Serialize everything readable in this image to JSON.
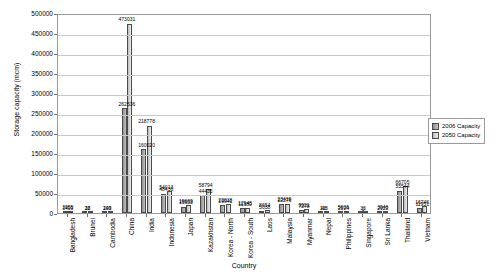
{
  "chart_data": {
    "type": "bar",
    "title": "",
    "xlabel": "Country",
    "ylabel": "Storage capacity (mcm)",
    "ylim": [
      0,
      500000
    ],
    "ytick_step": 50000,
    "grid": true,
    "legend_position": "right",
    "categories": [
      "Bangladesh",
      "Brunei",
      "Cambodia",
      "China",
      "India",
      "Indonesia",
      "Japan",
      "Kazakhstan",
      "Korea - North",
      "Korea - South",
      "Laos",
      "Malaysia",
      "Myanmar",
      "Nepal",
      "Philippines",
      "Singapore",
      "Sri Lanka",
      "Thailand",
      "Vietnam"
    ],
    "series": [
      {
        "name": "2006 Capacity",
        "color": "#b0b0b0",
        "values": [
          3955,
          38,
          209,
          262536,
          160020,
          48430,
          15633,
          44435,
          19941,
          11380,
          5038,
          22276,
          7278,
          48,
          2524,
          0,
          2022,
          55544,
          11951
        ]
      },
      {
        "name": "2050 Capacity",
        "color": "#d9d9d9",
        "values": [
          1409,
          22,
          143,
          473031,
          218778,
          54013,
          19669,
          58794,
          22018,
          12945,
          8654,
          23419,
          9921,
          113,
          5006,
          33,
          3946,
          66705,
          16746
        ]
      }
    ],
    "yticks": [
      "0",
      "50000",
      "100000",
      "150000",
      "200000",
      "250000",
      "300000",
      "350000",
      "400000",
      "450000",
      "500000"
    ],
    "point_labels": {
      "Bangladesh": {
        "top": "3955",
        "bottom": "1409"
      },
      "Brunei": {
        "top": "38",
        "bottom": "22"
      },
      "Cambodia": {
        "top": "209",
        "bottom": "143"
      },
      "China": {
        "top": "473031",
        "bottom": "262536"
      },
      "India": {
        "top": "218778",
        "bottom": "160020"
      },
      "Indonesia": {
        "top": "54013",
        "bottom": "48430"
      },
      "Japan": {
        "top": "19669",
        "bottom": "15633"
      },
      "Kazakhstan": {
        "top": "58794",
        "bottom": "44435"
      },
      "Korea - North": {
        "top": "22018",
        "bottom": "19941"
      },
      "Korea - South": {
        "top": "12945",
        "bottom": "11380"
      },
      "Laos": {
        "top": "8654",
        "bottom": "5038"
      },
      "Malaysia": {
        "top": "23419",
        "bottom": "22276"
      },
      "Myanmar": {
        "top": "9921",
        "bottom": "7278"
      },
      "Nepal": {
        "top": "113",
        "bottom": "48"
      },
      "Philippines": {
        "top": "5006",
        "bottom": "2524"
      },
      "Singapore": {
        "top": "33",
        "bottom": "0"
      },
      "Sri Lanka": {
        "top": "3946",
        "bottom": "2022"
      },
      "Thailand": {
        "top": "66705",
        "bottom": "55544"
      },
      "Vietnam": {
        "top": "16746",
        "bottom": "11951"
      }
    }
  },
  "legend": {
    "items": [
      {
        "label": "2006 Capacity"
      },
      {
        "label": "2050 Capacity"
      }
    ]
  }
}
